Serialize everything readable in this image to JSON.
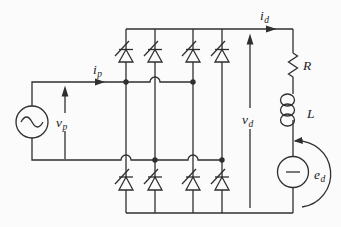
{
  "diagram": {
    "type": "circuit-schematic",
    "bridge": {
      "legs": 4,
      "thyristors_per_leg": 2,
      "total_thyristors": 8
    }
  },
  "labels": {
    "i_p": {
      "base": "i",
      "sub": "p"
    },
    "i_d": {
      "base": "i",
      "sub": "d"
    },
    "v_p": {
      "base": "v",
      "sub": "p"
    },
    "v_d": {
      "base": "v",
      "sub": "d"
    },
    "e_d": {
      "base": "e",
      "sub": "d"
    },
    "resistor": "R",
    "inductor": "L"
  },
  "symbols": {
    "ac_source": "ac-voltage-source-symbol",
    "dc_source": "dc-emf-source-symbol",
    "thyristor": "thyristor-symbol",
    "resistor": "resistor-zigzag-symbol",
    "inductor": "inductor-coil-symbol",
    "junction": "junction-dot",
    "crossover": "wire-hop-crossover"
  },
  "colors": {
    "background": "#fbfbfb",
    "line": "#2f2f2f",
    "text": "#1c1c1c"
  }
}
